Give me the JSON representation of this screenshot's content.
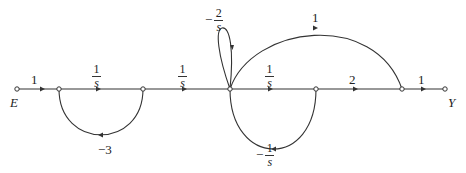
{
  "diagram": {
    "type": "signal-flow-graph",
    "input_node": "E",
    "output_node": "Y",
    "nodes": [
      {
        "id": "E",
        "x": 17,
        "y": 89,
        "label": "E"
      },
      {
        "id": "n1",
        "x": 59,
        "y": 89
      },
      {
        "id": "n2",
        "x": 143,
        "y": 89
      },
      {
        "id": "n3",
        "x": 230,
        "y": 89
      },
      {
        "id": "n4",
        "x": 316,
        "y": 89
      },
      {
        "id": "n5",
        "x": 402,
        "y": 89
      },
      {
        "id": "Y",
        "x": 445,
        "y": 89,
        "label": "Y"
      }
    ],
    "branches": [
      {
        "from": "E",
        "to": "n1",
        "gain": "1"
      },
      {
        "from": "n1",
        "to": "n2",
        "gain": "1/s",
        "num": "1",
        "den": "s",
        "sign": ""
      },
      {
        "from": "n2",
        "to": "n3",
        "gain": "1/s",
        "num": "1",
        "den": "s",
        "sign": ""
      },
      {
        "from": "n3",
        "to": "n4",
        "gain": "1/s",
        "num": "1",
        "den": "s",
        "sign": ""
      },
      {
        "from": "n4",
        "to": "n5",
        "gain": "2"
      },
      {
        "from": "n5",
        "to": "Y",
        "gain": "1"
      },
      {
        "from": "n2",
        "to": "n1",
        "gain": "-3",
        "kind": "feedback-arc-below"
      },
      {
        "from": "n4",
        "to": "n3",
        "gain": "-1/s",
        "num": "1",
        "den": "s",
        "sign": "−",
        "kind": "feedback-arc-below"
      },
      {
        "from": "n3",
        "to": "n3",
        "gain": "-2/s",
        "num": "2",
        "den": "s",
        "sign": "−",
        "kind": "self-loop"
      },
      {
        "from": "n3",
        "to": "n5",
        "gain": "1",
        "kind": "feedforward-arc-above"
      }
    ]
  },
  "labels": {
    "E": "E",
    "Y": "Y",
    "g_E_n1": "1",
    "g_n4_n5": "2",
    "g_n5_Y": "1",
    "g_feedforward": "1",
    "g_fb1": "−3",
    "frac_n1_n2": {
      "num": "1",
      "den": "s"
    },
    "frac_n2_n3": {
      "num": "1",
      "den": "s"
    },
    "frac_n3_n4": {
      "num": "1",
      "den": "s"
    },
    "frac_selfloop": {
      "sign": "−",
      "num": "2",
      "den": "s"
    },
    "frac_fb2": {
      "sign": "−",
      "num": "1",
      "den": "s"
    }
  }
}
